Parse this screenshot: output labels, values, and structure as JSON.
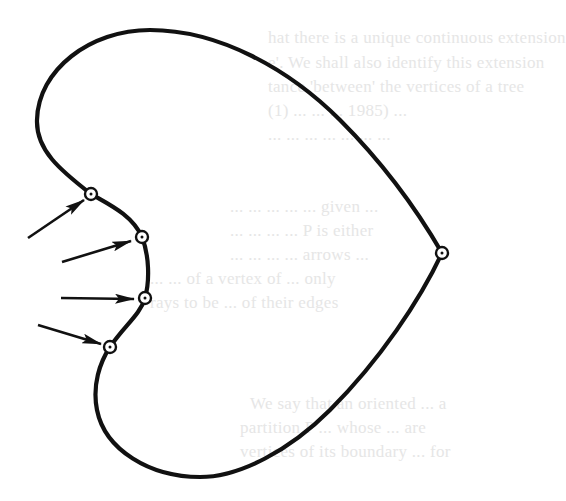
{
  "figure": {
    "type": "heart-shaped closed curve with vertex markers and arrows",
    "stroke_color": "#111111",
    "background": "#ffffff",
    "ghost_text_color": "#e6e6e6",
    "vertices": [
      {
        "id": "v1",
        "x": 91,
        "y": 194,
        "pointed_by_arrow": true
      },
      {
        "id": "v2",
        "x": 142,
        "y": 237,
        "pointed_by_arrow": true
      },
      {
        "id": "v3",
        "x": 145,
        "y": 298,
        "pointed_by_arrow": true
      },
      {
        "id": "v4",
        "x": 110,
        "y": 347,
        "pointed_by_arrow": true
      },
      {
        "id": "v5",
        "x": 442,
        "y": 253,
        "pointed_by_arrow": false
      }
    ],
    "arrows": [
      {
        "id": "a1",
        "from": [
          28,
          238
        ],
        "to": [
          84,
          200
        ]
      },
      {
        "id": "a2",
        "from": [
          62,
          262
        ],
        "to": [
          131,
          241
        ]
      },
      {
        "id": "a3",
        "from": [
          61,
          298
        ],
        "to": [
          134,
          299
        ]
      },
      {
        "id": "a4",
        "from": [
          38,
          325
        ],
        "to": [
          101,
          344
        ]
      }
    ]
  },
  "ghost_text": {
    "lines": [
      {
        "text": "hat there is a unique continuous extension",
        "x": 268,
        "y": 42
      },
      {
        "text": "e'. We shall also identify this extension",
        "x": 268,
        "y": 67
      },
      {
        "text": "tance 'between' the vertices of a tree",
        "x": 268,
        "y": 91
      },
      {
        "text": "(1) ... ... ... 1985) ...",
        "x": 268,
        "y": 115
      },
      {
        "text": "... ... ... ... ... ... ...",
        "x": 268,
        "y": 139
      },
      {
        "text": "... ... ... ... ... given ...",
        "x": 230,
        "y": 211
      },
      {
        "text": "... ... ... ... P is either",
        "x": 230,
        "y": 235
      },
      {
        "text": "... ... ... ... arrows ...",
        "x": 230,
        "y": 259
      },
      {
        "text": "... ... of a vertex of ... only",
        "x": 150,
        "y": 283
      },
      {
        "text": "rays to be ... of their edges",
        "x": 150,
        "y": 307
      },
      {
        "text": "We say that an oriented ... a",
        "x": 250,
        "y": 408
      },
      {
        "text": "partition P ... whose ... are",
        "x": 240,
        "y": 432
      },
      {
        "text": "vertices of its boundary ... for",
        "x": 240,
        "y": 456
      }
    ]
  }
}
